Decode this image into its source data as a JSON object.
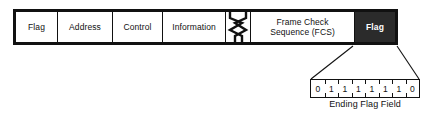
{
  "diagram": {
    "colors": {
      "background": "#ffffff",
      "line": "#111111",
      "highlight_fill": "#2b2b2b",
      "highlight_text": "#ffffff"
    },
    "frame_fields": [
      {
        "label": "Flag",
        "name": "flag-start",
        "highlighted": false
      },
      {
        "label": "Address",
        "name": "address",
        "highlighted": false
      },
      {
        "label": "Control",
        "name": "control",
        "highlighted": false
      },
      {
        "label": "Information",
        "name": "information",
        "highlighted": false
      },
      {
        "label": "",
        "name": "break-symbol",
        "highlighted": false
      },
      {
        "label": "Frame Check Sequence (FCS)",
        "name": "fcs",
        "highlighted": false
      },
      {
        "label": "Flag",
        "name": "flag-end",
        "highlighted": true
      }
    ],
    "fcs_line1": "Frame Check",
    "fcs_line2": "Sequence (FCS)",
    "callout": {
      "caption": "Ending Flag Field",
      "bits": [
        "0",
        "1",
        "1",
        "1",
        "1",
        "1",
        "1",
        "0"
      ],
      "bit_string": "01111110"
    }
  }
}
